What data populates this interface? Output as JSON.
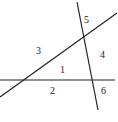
{
  "diagram": {
    "lines": [
      "horizontal-line",
      "diagonal-line",
      "transversal-line"
    ],
    "angle_labels": [
      "1",
      "2",
      "3",
      "4",
      "5",
      "6"
    ]
  }
}
